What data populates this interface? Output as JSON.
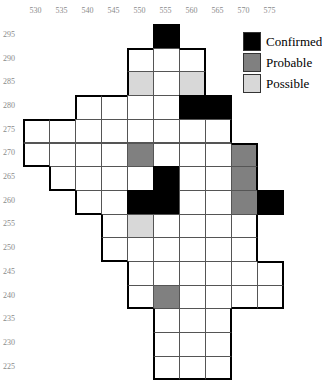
{
  "map": {
    "x_labels": [
      "530",
      "535",
      "540",
      "545",
      "550",
      "555",
      "560",
      "565",
      "570",
      "575"
    ],
    "y_labels": [
      "295",
      "290",
      "285",
      "280",
      "275",
      "270",
      "265",
      "260",
      "255",
      "250",
      "245",
      "240",
      "235",
      "230",
      "225"
    ],
    "rows": [
      {
        "y": "295",
        "cells": [
          {
            "x": "555",
            "status": "confirmed"
          }
        ]
      },
      {
        "y": "290",
        "cells": [
          {
            "x": "550",
            "status": "none"
          },
          {
            "x": "555",
            "status": "none"
          },
          {
            "x": "560",
            "status": "none"
          }
        ]
      },
      {
        "y": "285",
        "cells": [
          {
            "x": "550",
            "status": "possible"
          },
          {
            "x": "555",
            "status": "none"
          },
          {
            "x": "560",
            "status": "possible"
          }
        ]
      },
      {
        "y": "280",
        "cells": [
          {
            "x": "540",
            "status": "none"
          },
          {
            "x": "545",
            "status": "none"
          },
          {
            "x": "550",
            "status": "none"
          },
          {
            "x": "555",
            "status": "none"
          },
          {
            "x": "560",
            "status": "confirmed"
          },
          {
            "x": "565",
            "status": "confirmed"
          }
        ]
      },
      {
        "y": "275",
        "cells": [
          {
            "x": "530",
            "status": "none"
          },
          {
            "x": "535",
            "status": "none"
          },
          {
            "x": "540",
            "status": "none"
          },
          {
            "x": "545",
            "status": "none"
          },
          {
            "x": "550",
            "status": "none"
          },
          {
            "x": "555",
            "status": "none"
          },
          {
            "x": "560",
            "status": "none"
          },
          {
            "x": "565",
            "status": "none"
          }
        ]
      },
      {
        "y": "270",
        "cells": [
          {
            "x": "530",
            "status": "none"
          },
          {
            "x": "535",
            "status": "none"
          },
          {
            "x": "540",
            "status": "none"
          },
          {
            "x": "545",
            "status": "none"
          },
          {
            "x": "550",
            "status": "probable"
          },
          {
            "x": "555",
            "status": "none"
          },
          {
            "x": "560",
            "status": "none"
          },
          {
            "x": "565",
            "status": "none"
          },
          {
            "x": "570",
            "status": "probable"
          }
        ]
      },
      {
        "y": "265",
        "cells": [
          {
            "x": "535",
            "status": "none"
          },
          {
            "x": "540",
            "status": "none"
          },
          {
            "x": "545",
            "status": "none"
          },
          {
            "x": "550",
            "status": "none"
          },
          {
            "x": "555",
            "status": "confirmed"
          },
          {
            "x": "560",
            "status": "none"
          },
          {
            "x": "565",
            "status": "none"
          },
          {
            "x": "570",
            "status": "probable"
          }
        ]
      },
      {
        "y": "260",
        "cells": [
          {
            "x": "540",
            "status": "none"
          },
          {
            "x": "545",
            "status": "none"
          },
          {
            "x": "550",
            "status": "confirmed"
          },
          {
            "x": "555",
            "status": "confirmed"
          },
          {
            "x": "560",
            "status": "none"
          },
          {
            "x": "565",
            "status": "none"
          },
          {
            "x": "570",
            "status": "probable"
          },
          {
            "x": "575",
            "status": "confirmed"
          }
        ]
      },
      {
        "y": "255",
        "cells": [
          {
            "x": "545",
            "status": "none"
          },
          {
            "x": "550",
            "status": "possible"
          },
          {
            "x": "555",
            "status": "none"
          },
          {
            "x": "560",
            "status": "none"
          },
          {
            "x": "565",
            "status": "none"
          },
          {
            "x": "570",
            "status": "none"
          }
        ]
      },
      {
        "y": "250",
        "cells": [
          {
            "x": "545",
            "status": "none"
          },
          {
            "x": "550",
            "status": "none"
          },
          {
            "x": "555",
            "status": "none"
          },
          {
            "x": "560",
            "status": "none"
          },
          {
            "x": "565",
            "status": "none"
          },
          {
            "x": "570",
            "status": "none"
          }
        ]
      },
      {
        "y": "245",
        "cells": [
          {
            "x": "550",
            "status": "none"
          },
          {
            "x": "555",
            "status": "none"
          },
          {
            "x": "560",
            "status": "none"
          },
          {
            "x": "565",
            "status": "none"
          },
          {
            "x": "570",
            "status": "none"
          },
          {
            "x": "575",
            "status": "none"
          }
        ]
      },
      {
        "y": "240",
        "cells": [
          {
            "x": "550",
            "status": "none"
          },
          {
            "x": "555",
            "status": "probable"
          },
          {
            "x": "560",
            "status": "none"
          },
          {
            "x": "565",
            "status": "none"
          },
          {
            "x": "570",
            "status": "none"
          },
          {
            "x": "575",
            "status": "none"
          }
        ]
      },
      {
        "y": "235",
        "cells": [
          {
            "x": "555",
            "status": "none"
          },
          {
            "x": "560",
            "status": "none"
          },
          {
            "x": "565",
            "status": "none"
          }
        ]
      },
      {
        "y": "230",
        "cells": [
          {
            "x": "555",
            "status": "none"
          },
          {
            "x": "560",
            "status": "none"
          },
          {
            "x": "565",
            "status": "none"
          }
        ]
      },
      {
        "y": "225",
        "cells": [
          {
            "x": "555",
            "status": "none"
          },
          {
            "x": "560",
            "status": "none"
          },
          {
            "x": "565",
            "status": "none"
          }
        ]
      }
    ]
  },
  "legend": {
    "items": [
      {
        "label": "Confirmed",
        "status": "confirmed"
      },
      {
        "label": "Probable",
        "status": "probable"
      },
      {
        "label": "Possible",
        "status": "possible"
      }
    ]
  },
  "colors": {
    "confirmed": "#000000",
    "probable": "#808080",
    "possible": "#d8d8d8",
    "none": "#ffffff"
  }
}
